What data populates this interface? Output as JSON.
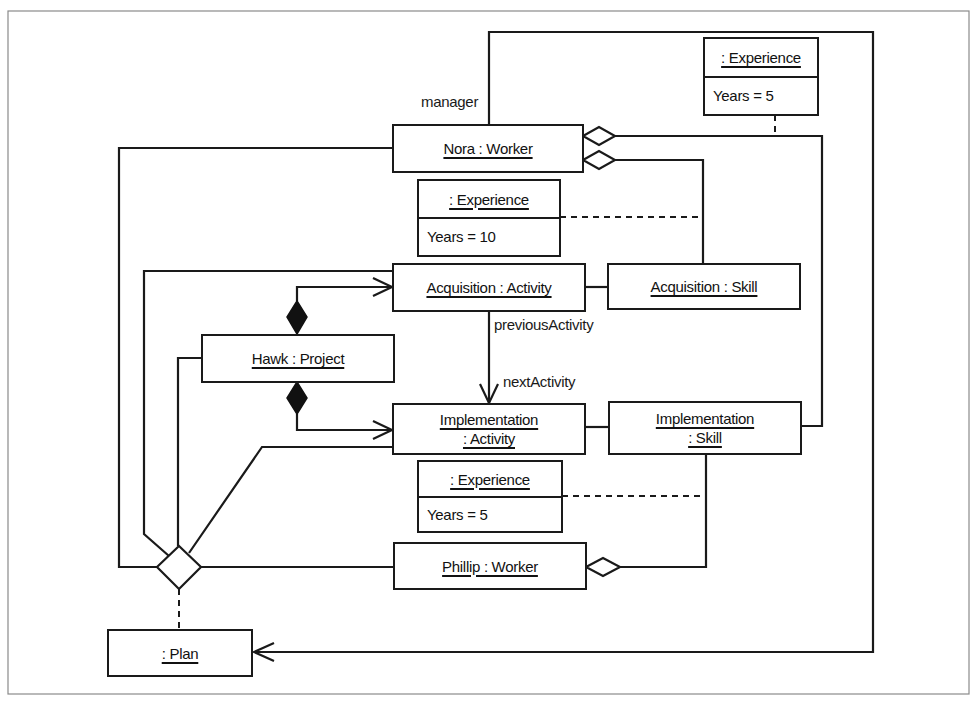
{
  "diagram": {
    "type": "UML object diagram",
    "objects": {
      "nora_worker": {
        "label": "Nora : Worker"
      },
      "acquisition_activity": {
        "label": "Acquisition : Activity"
      },
      "acquisition_skill": {
        "label": "Acquisition : Skill"
      },
      "hawk_project": {
        "label": "Hawk : Project"
      },
      "implementation_activity": {
        "line1": "Implementation",
        "line2": ": Activity"
      },
      "implementation_skill": {
        "line1": "Implementation",
        "line2": ": Skill"
      },
      "phillip_worker": {
        "label": "Phillip : Worker"
      },
      "plan": {
        "label": ": Plan"
      }
    },
    "link_objects": [
      {
        "name": ": Experience",
        "attribute": "Years = 5",
        "links": "Nora : Worker — Implementation : Skill"
      },
      {
        "name": ": Experience",
        "attribute": "Years = 10",
        "links": "Nora : Worker — Acquisition : Skill"
      },
      {
        "name": ": Experience",
        "attribute": "Years = 5",
        "links": "Phillip : Worker — Implementation : Skill"
      }
    ],
    "role_labels": {
      "manager": "manager",
      "previous_activity": "previousActivity",
      "next_activity": "nextActivity"
    },
    "colors": {
      "line": "#1a1a1a",
      "background": "#ffffff",
      "frame": "#8a8a8a"
    }
  }
}
